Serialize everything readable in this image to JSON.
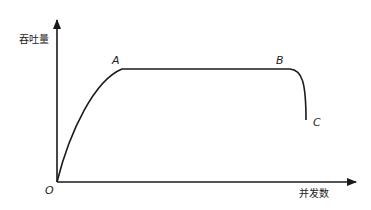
{
  "diagram": {
    "type": "throughput-vs-concurrency curve",
    "y_axis_label": "吞吐量",
    "x_axis_label": "并发数",
    "origin_label": "O",
    "points": [
      {
        "id": "A",
        "label": "A",
        "description": "start of plateau"
      },
      {
        "id": "B",
        "label": "B",
        "description": "end of plateau"
      },
      {
        "id": "C",
        "label": "C",
        "description": "throughput drop-off end"
      }
    ],
    "line_color": "#1a1a1a"
  }
}
